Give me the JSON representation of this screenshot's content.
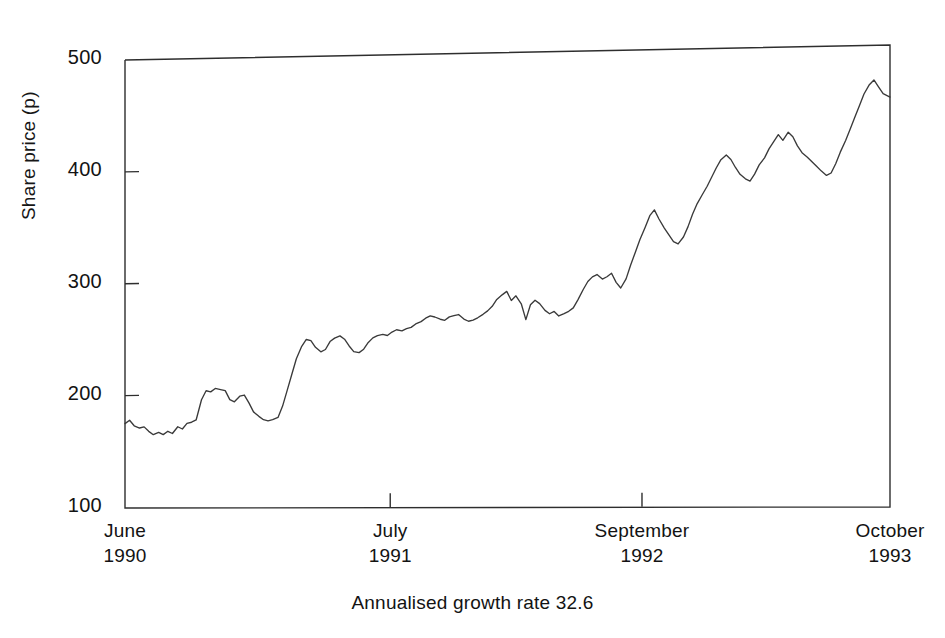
{
  "chart_data": {
    "type": "line",
    "title": "",
    "subtitle": "",
    "xlabel": "",
    "ylabel": "Share price (p)",
    "caption": "Annualised growth rate 32.6",
    "grid": false,
    "legend": null,
    "ylim": [
      100,
      500
    ],
    "yticks": [
      100,
      200,
      300,
      400,
      500
    ],
    "ytick_labels": [
      "100",
      "200",
      "300",
      "400",
      "500"
    ],
    "xtick_positions": [
      0,
      0.3467,
      0.6758,
      1.0
    ],
    "xtick_labels": [
      {
        "month": "June",
        "year": "1990"
      },
      {
        "month": "July",
        "year": "1991"
      },
      {
        "month": "September",
        "year": "1992"
      },
      {
        "month": "October",
        "year": "1993"
      }
    ],
    "series": [
      {
        "name": "Share price",
        "color": "#3a3a3a",
        "x": [
          0.0,
          0.006,
          0.012,
          0.019,
          0.025,
          0.031,
          0.037,
          0.044,
          0.05,
          0.056,
          0.062,
          0.069,
          0.075,
          0.081,
          0.087,
          0.093,
          0.1,
          0.106,
          0.112,
          0.118,
          0.125,
          0.131,
          0.137,
          0.143,
          0.15,
          0.156,
          0.162,
          0.168,
          0.175,
          0.181,
          0.187,
          0.193,
          0.2,
          0.206,
          0.212,
          0.218,
          0.224,
          0.231,
          0.237,
          0.243,
          0.249,
          0.256,
          0.262,
          0.268,
          0.274,
          0.281,
          0.287,
          0.293,
          0.299,
          0.306,
          0.312,
          0.318,
          0.324,
          0.33,
          0.337,
          0.343,
          0.349,
          0.355,
          0.362,
          0.368,
          0.374,
          0.38,
          0.387,
          0.393,
          0.399,
          0.405,
          0.412,
          0.418,
          0.424,
          0.43,
          0.436,
          0.443,
          0.449,
          0.455,
          0.461,
          0.468,
          0.474,
          0.48,
          0.486,
          0.493,
          0.499,
          0.505,
          0.511,
          0.518,
          0.524,
          0.53,
          0.536,
          0.542,
          0.549,
          0.555,
          0.561,
          0.567,
          0.574,
          0.58,
          0.586,
          0.592,
          0.599,
          0.605,
          0.611,
          0.617,
          0.624,
          0.63,
          0.636,
          0.642,
          0.648,
          0.655,
          0.661,
          0.667,
          0.673,
          0.68,
          0.686,
          0.692,
          0.698,
          0.705,
          0.711,
          0.717,
          0.723,
          0.73,
          0.736,
          0.742,
          0.748,
          0.754,
          0.761,
          0.767,
          0.773,
          0.779,
          0.786,
          0.792,
          0.798,
          0.804,
          0.811,
          0.817,
          0.823,
          0.829,
          0.836,
          0.842,
          0.848,
          0.854,
          0.86,
          0.867,
          0.873,
          0.879,
          0.885,
          0.892,
          0.898,
          0.904,
          0.91,
          0.917,
          0.923,
          0.929,
          0.935,
          0.942,
          0.948,
          0.954,
          0.96,
          0.966,
          0.973,
          0.979,
          0.985,
          0.991,
          1.0
        ],
        "y": [
          175,
          178,
          173,
          171,
          172,
          168,
          165,
          167,
          165,
          168,
          166,
          172,
          170,
          175,
          176,
          178,
          196,
          204,
          203,
          206,
          205,
          204,
          196,
          194,
          199,
          200,
          193,
          185,
          181,
          178,
          177,
          178,
          180,
          190,
          204,
          218,
          232,
          243,
          249,
          248,
          242,
          238,
          240,
          247,
          250,
          252,
          249,
          243,
          238,
          237,
          240,
          246,
          250,
          252,
          253,
          252,
          255,
          257,
          256,
          258,
          259,
          262,
          264,
          267,
          269,
          268,
          266,
          265,
          268,
          269,
          270,
          266,
          264,
          265,
          267,
          270,
          273,
          277,
          283,
          287,
          290,
          282,
          286,
          279,
          265,
          278,
          282,
          279,
          273,
          270,
          272,
          268,
          270,
          272,
          275,
          282,
          291,
          298,
          302,
          304,
          300,
          302,
          305,
          297,
          292,
          300,
          312,
          323,
          334,
          345,
          355,
          360,
          352,
          344,
          338,
          332,
          330,
          336,
          345,
          356,
          365,
          372,
          380,
          388,
          396,
          403,
          407,
          403,
          396,
          390,
          386,
          384,
          390,
          398,
          404,
          412,
          418,
          424,
          419,
          426,
          422,
          414,
          408,
          404,
          400,
          396,
          392,
          388,
          390,
          398,
          408,
          418,
          428,
          438,
          448,
          458,
          466,
          470,
          464,
          458,
          455
        ]
      }
    ]
  },
  "axis": {
    "y_label": "Share price (p)"
  },
  "caption": {
    "text": "Annualised growth rate 32.6"
  }
}
